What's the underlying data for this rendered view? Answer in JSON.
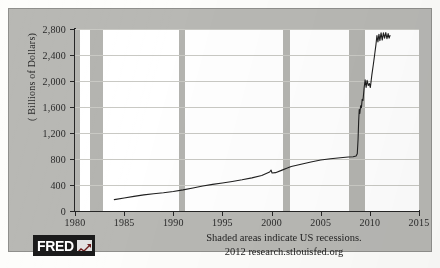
{
  "chart_data": {
    "type": "line",
    "title": "",
    "subtitle": "",
    "xlabel": "",
    "ylabel": "( Billions of Dollars)",
    "xlim": [
      1980,
      2015
    ],
    "ylim": [
      0,
      2800
    ],
    "ytick_labels": [
      "0",
      "400",
      "800",
      "1,200",
      "1,600",
      "2,000",
      "2,400",
      "2,800"
    ],
    "ytick_values": [
      0,
      400,
      800,
      1200,
      1600,
      2000,
      2400,
      2800
    ],
    "xtick_labels": [
      "1980",
      "1985",
      "1990",
      "1995",
      "2000",
      "2005",
      "2010",
      "2015"
    ],
    "xtick_values": [
      1980,
      1985,
      1990,
      1995,
      2000,
      2005,
      2010,
      2015
    ],
    "grid": true,
    "legend": "none",
    "line_color": "#1f1f1f",
    "recession_band_color": "#b4b4b0",
    "annotations": [
      "Shaded areas indicate US recessions.",
      "2012 research.stlouisfed.org"
    ],
    "recessions": [
      {
        "start": 1980.0,
        "end": 1980.5
      },
      {
        "start": 1981.5,
        "end": 1982.9
      },
      {
        "start": 1990.6,
        "end": 1991.2
      },
      {
        "start": 2001.2,
        "end": 2001.9
      },
      {
        "start": 2007.9,
        "end": 2009.5
      }
    ],
    "series": [
      {
        "name": "Total Reserve Balances",
        "points": [
          [
            1984.0,
            175
          ],
          [
            1985.0,
            200
          ],
          [
            1986.0,
            225
          ],
          [
            1987.0,
            248
          ],
          [
            1988.0,
            265
          ],
          [
            1989.0,
            280
          ],
          [
            1990.0,
            300
          ],
          [
            1991.0,
            325
          ],
          [
            1992.0,
            355
          ],
          [
            1993.0,
            385
          ],
          [
            1994.0,
            410
          ],
          [
            1995.0,
            432
          ],
          [
            1996.0,
            455
          ],
          [
            1997.0,
            480
          ],
          [
            1998.0,
            510
          ],
          [
            1999.0,
            545
          ],
          [
            1999.8,
            600
          ],
          [
            1999.95,
            628
          ],
          [
            2000.05,
            585
          ],
          [
            2000.4,
            590
          ],
          [
            2001.0,
            625
          ],
          [
            2001.6,
            660
          ],
          [
            2002.0,
            685
          ],
          [
            2003.0,
            720
          ],
          [
            2004.0,
            755
          ],
          [
            2005.0,
            785
          ],
          [
            2006.0,
            805
          ],
          [
            2007.0,
            820
          ],
          [
            2007.8,
            830
          ],
          [
            2008.3,
            835
          ],
          [
            2008.6,
            845
          ],
          [
            2008.72,
            880
          ],
          [
            2008.8,
            1100
          ],
          [
            2008.86,
            1380
          ],
          [
            2008.92,
            1560
          ],
          [
            2008.98,
            1500
          ],
          [
            2009.06,
            1620
          ],
          [
            2009.14,
            1590
          ],
          [
            2009.22,
            1720
          ],
          [
            2009.3,
            1700
          ],
          [
            2009.42,
            1900
          ],
          [
            2009.52,
            2020
          ],
          [
            2009.62,
            1900
          ],
          [
            2009.72,
            2010
          ],
          [
            2009.84,
            1930
          ],
          [
            2009.95,
            1960
          ],
          [
            2010.05,
            1900
          ],
          [
            2010.2,
            2090
          ],
          [
            2010.35,
            2250
          ],
          [
            2010.5,
            2420
          ],
          [
            2010.62,
            2560
          ],
          [
            2010.72,
            2700
          ],
          [
            2010.82,
            2600
          ],
          [
            2010.92,
            2720
          ],
          [
            2011.02,
            2620
          ],
          [
            2011.14,
            2740
          ],
          [
            2011.26,
            2630
          ],
          [
            2011.38,
            2740
          ],
          [
            2011.5,
            2660
          ],
          [
            2011.62,
            2745
          ],
          [
            2011.74,
            2650
          ],
          [
            2011.86,
            2730
          ],
          [
            2011.96,
            2660
          ],
          [
            2012.05,
            2700
          ]
        ]
      }
    ]
  },
  "branding": {
    "logo_word": "FRED",
    "logo_mark_name": "chart-arrow-mark"
  }
}
